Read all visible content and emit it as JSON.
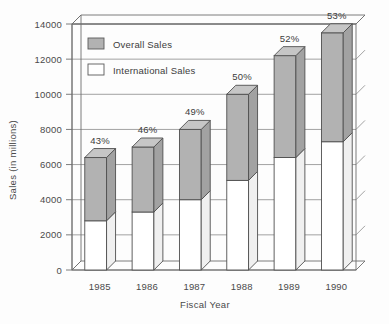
{
  "chart_data": {
    "type": "bar",
    "subtype": "stacked-3d-column",
    "title": "",
    "xlabel": "Fiscal Year",
    "ylabel": "Sales (in millions)",
    "categories": [
      "1985",
      "1986",
      "1987",
      "1988",
      "1989",
      "1990"
    ],
    "ylim": [
      0,
      14000
    ],
    "ytick_labels": [
      "0",
      "2000",
      "4000",
      "6000",
      "8000",
      "10000",
      "12000",
      "14000"
    ],
    "ytick_values": [
      0,
      2000,
      4000,
      6000,
      8000,
      10000,
      12000,
      14000
    ],
    "grid": true,
    "grid_axis": "y",
    "legend_position": "top-left-inside",
    "series": [
      {
        "name": "International Sales",
        "color": "#ffffff",
        "values": [
          2800,
          3300,
          4000,
          5100,
          6400,
          7300
        ]
      },
      {
        "name": "Overall Sales",
        "color": "#b2b2b2",
        "values": [
          6400,
          7000,
          8000,
          10000,
          12200,
          13500
        ],
        "note": "segment drawn above international portion; value is the bar total"
      }
    ],
    "annotations": [
      "43%",
      "46%",
      "49%",
      "50%",
      "52%",
      "53%"
    ],
    "annotation_meaning": "International sales as percent of overall sales"
  },
  "legend": {
    "items": [
      {
        "label": "Overall Sales",
        "swatch": "gray"
      },
      {
        "label": "International Sales",
        "swatch": "white"
      }
    ]
  },
  "axes": {
    "y_title": "Sales (in millions)",
    "x_title": "Fiscal Year"
  }
}
